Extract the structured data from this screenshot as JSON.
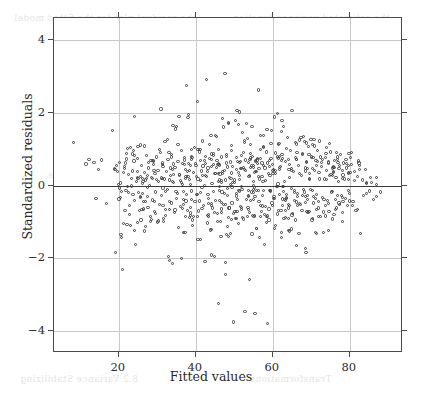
{
  "figure": {
    "name": "residuals-vs-fitted-scatter",
    "background_color": "#ffffff",
    "frame_color": "#4a4a4a",
    "grid_color": "#c8c8c8",
    "zero_line_color": "#3a3a3a",
    "point_color": "#3c3c3c"
  },
  "axis": {
    "x_label": "Fitted values",
    "y_label": "Standardized residuals",
    "x_ticks": [
      20,
      40,
      60,
      80
    ],
    "y_ticks": [
      4,
      2,
      0,
      -2,
      -4
    ],
    "x_tick_labels": [
      "20",
      "40",
      "60",
      "80"
    ],
    "y_tick_labels": [
      "4",
      "2",
      "0",
      "−2",
      "−4"
    ]
  },
  "bleed_text": [
    {
      "text": "the residual plot for the fitted model",
      "x": 14,
      "y": 13,
      "size": 9
    },
    {
      "text": "the estimated variance function",
      "x": 232,
      "y": 13,
      "size": 9
    },
    {
      "text": "standard deviation",
      "x": 66,
      "y": 86,
      "size": 9
    },
    {
      "text": "and the mean function",
      "x": 200,
      "y": 86,
      "size": 9
    },
    {
      "text": "residuals against",
      "x": 80,
      "y": 142,
      "size": 9
    },
    {
      "text": "the fitted values are",
      "x": 236,
      "y": 142,
      "size": 9
    },
    {
      "text": "of the variance",
      "x": 48,
      "y": 170,
      "size": 9
    },
    {
      "text": "plotted in",
      "x": 250,
      "y": 170,
      "size": 9
    },
    {
      "text": "nonconstant variance",
      "x": 196,
      "y": 280,
      "size": 9
    },
    {
      "text": "8.2  Variance Stabilizing",
      "x": 20,
      "y": 374,
      "size": 9
    },
    {
      "text": "Transformations",
      "x": 250,
      "y": 374,
      "size": 9
    }
  ],
  "chart_data": {
    "type": "scatter",
    "title": "",
    "subtitle": "",
    "xlabel": "Fitted values",
    "ylabel": "Standardized residuals",
    "xlim": [
      3.2,
      93.8
    ],
    "ylim": [
      -4.6,
      4.6
    ],
    "grid": true,
    "legend": null,
    "annotations": [
      {
        "type": "hline",
        "y": 0,
        "description": "reference line at zero residual"
      }
    ],
    "x_ticks": [
      20,
      40,
      60,
      80
    ],
    "y_ticks": [
      4,
      2,
      0,
      -2,
      -4
    ],
    "n_points": 812,
    "marker": {
      "shape": "open-circle",
      "size_px": 3.2,
      "stroke": "#3c3c3c",
      "fill": "none"
    },
    "points": [
      [
        8.2,
        1.18
      ],
      [
        11.5,
        0.59
      ],
      [
        12.3,
        0.72
      ],
      [
        13.6,
        0.63
      ],
      [
        14.1,
        -0.35
      ],
      [
        14.8,
        0.45
      ],
      [
        15.6,
        0.7
      ],
      [
        16.9,
        -0.5
      ],
      [
        18.4,
        1.5
      ],
      [
        18.9,
        0.46
      ],
      [
        19.1,
        -1.85
      ],
      [
        19.6,
        0.38
      ],
      [
        19.9,
        0.03
      ],
      [
        20.1,
        -0.07
      ],
      [
        20.4,
        -0.32
      ],
      [
        20.6,
        -1.35
      ],
      [
        20.8,
        -1.42
      ],
      [
        21.0,
        -2.3
      ],
      [
        21.2,
        -1.05
      ],
      [
        21.5,
        0.52
      ],
      [
        21.7,
        0.62
      ],
      [
        21.9,
        -0.13
      ],
      [
        22.1,
        0.88
      ],
      [
        22.3,
        1.02
      ],
      [
        22.5,
        0.3
      ],
      [
        22.7,
        -0.55
      ],
      [
        22.9,
        -0.8
      ],
      [
        23.1,
        -1.1
      ],
      [
        23.3,
        0.2
      ],
      [
        23.5,
        0.4
      ],
      [
        23.7,
        -0.25
      ],
      [
        23.9,
        0.95
      ],
      [
        24.1,
        1.9
      ],
      [
        24.2,
        -0.42
      ],
      [
        24.4,
        -1.62
      ],
      [
        24.6,
        0.12
      ],
      [
        24.8,
        0.75
      ],
      [
        25.0,
        1.08
      ],
      [
        25.2,
        -0.2
      ],
      [
        25.4,
        -0.68
      ],
      [
        25.6,
        0.25
      ],
      [
        25.8,
        -0.95
      ],
      [
        26.0,
        0.55
      ],
      [
        26.2,
        0.05
      ],
      [
        26.4,
        -0.45
      ],
      [
        26.6,
        0.35
      ],
      [
        26.8,
        -1.25
      ],
      [
        27.0,
        0.15
      ],
      [
        27.2,
        0.82
      ],
      [
        27.4,
        -0.3
      ],
      [
        27.6,
        -0.6
      ],
      [
        27.8,
        0.48
      ],
      [
        28.0,
        0.0
      ],
      [
        28.2,
        -0.85
      ],
      [
        28.4,
        0.68
      ],
      [
        28.6,
        0.22
      ],
      [
        28.8,
        -0.4
      ],
      [
        29.0,
        0.58
      ],
      [
        29.2,
        -0.72
      ],
      [
        29.4,
        0.32
      ],
      [
        29.6,
        -0.18
      ],
      [
        29.8,
        0.78
      ],
      [
        30.0,
        -1.0
      ],
      [
        30.2,
        0.42
      ],
      [
        30.4,
        0.1
      ],
      [
        30.6,
        -0.52
      ],
      [
        30.8,
        0.9
      ],
      [
        31.0,
        2.1
      ],
      [
        31.2,
        -0.28
      ],
      [
        31.4,
        0.62
      ],
      [
        31.6,
        -0.9
      ],
      [
        31.8,
        0.18
      ],
      [
        32.0,
        1.2
      ],
      [
        32.2,
        -0.65
      ],
      [
        32.4,
        0.38
      ],
      [
        32.6,
        -0.12
      ],
      [
        32.8,
        0.72
      ],
      [
        33.0,
        -1.95
      ],
      [
        33.2,
        -2.05
      ],
      [
        33.4,
        0.28
      ],
      [
        33.6,
        -0.48
      ],
      [
        33.8,
        0.85
      ],
      [
        34.0,
        -2.15
      ],
      [
        34.2,
        0.08
      ],
      [
        34.4,
        -0.75
      ],
      [
        34.6,
        0.5
      ],
      [
        34.8,
        1.55
      ],
      [
        35.0,
        1.62
      ],
      [
        35.2,
        -0.22
      ],
      [
        35.4,
        0.65
      ],
      [
        35.6,
        -1.15
      ],
      [
        35.8,
        0.3
      ],
      [
        36.0,
        -0.58
      ],
      [
        36.2,
        0.95
      ],
      [
        36.4,
        -2.0
      ],
      [
        36.6,
        0.02
      ],
      [
        36.8,
        -0.38
      ],
      [
        37.0,
        0.7
      ],
      [
        37.2,
        -1.3
      ],
      [
        37.4,
        0.45
      ],
      [
        37.6,
        2.75
      ],
      [
        37.8,
        -0.68
      ],
      [
        38.0,
        0.25
      ],
      [
        38.2,
        1.95
      ],
      [
        38.4,
        -0.88
      ],
      [
        38.6,
        0.55
      ],
      [
        38.8,
        -0.15
      ],
      [
        39.0,
        0.8
      ],
      [
        39.2,
        -0.95
      ],
      [
        39.4,
        0.35
      ],
      [
        39.6,
        1.05
      ],
      [
        39.8,
        -0.45
      ],
      [
        40.0,
        0.6
      ],
      [
        40.2,
        -0.25
      ],
      [
        40.4,
        2.3
      ],
      [
        40.6,
        0.18
      ],
      [
        40.8,
        -0.7
      ],
      [
        41.0,
        0.92
      ],
      [
        41.2,
        -1.48
      ],
      [
        41.4,
        0.4
      ],
      [
        41.6,
        -0.05
      ],
      [
        41.8,
        1.22
      ],
      [
        42.0,
        -0.55
      ],
      [
        42.2,
        0.68
      ],
      [
        42.4,
        -2.08
      ],
      [
        42.6,
        0.28
      ],
      [
        42.8,
        2.9
      ],
      [
        43.0,
        -0.82
      ],
      [
        43.2,
        0.48
      ],
      [
        43.4,
        -0.35
      ],
      [
        43.6,
        1.12
      ],
      [
        43.8,
        -1.22
      ],
      [
        44.0,
        0.72
      ],
      [
        44.2,
        0.05
      ],
      [
        44.4,
        -0.62
      ],
      [
        44.6,
        0.88
      ],
      [
        44.8,
        -1.95
      ],
      [
        45.0,
        0.32
      ],
      [
        45.2,
        -0.42
      ],
      [
        45.4,
        1.35
      ],
      [
        45.6,
        -0.78
      ],
      [
        45.8,
        0.58
      ],
      [
        46.0,
        -3.25
      ],
      [
        46.2,
        0.15
      ],
      [
        46.4,
        -0.98
      ],
      [
        46.6,
        0.78
      ],
      [
        46.8,
        -0.18
      ],
      [
        47.0,
        1.85
      ],
      [
        47.2,
        -0.52
      ],
      [
        47.4,
        0.42
      ],
      [
        47.6,
        3.08
      ],
      [
        47.8,
        -2.12
      ],
      [
        48.0,
        0.62
      ],
      [
        48.2,
        -0.28
      ],
      [
        48.4,
        1.7
      ],
      [
        48.6,
        -0.88
      ],
      [
        48.8,
        0.22
      ],
      [
        49.0,
        -1.32
      ],
      [
        49.2,
        0.95
      ],
      [
        49.4,
        -0.48
      ],
      [
        49.6,
        0.52
      ],
      [
        49.8,
        -3.75
      ],
      [
        50.0,
        0.08
      ],
      [
        50.2,
        -0.72
      ],
      [
        50.4,
        1.78
      ],
      [
        50.6,
        -0.22
      ],
      [
        50.8,
        0.65
      ],
      [
        51.0,
        -1.05
      ],
      [
        51.2,
        0.35
      ],
      [
        51.4,
        2.02
      ],
      [
        51.6,
        -0.58
      ],
      [
        51.8,
        0.82
      ],
      [
        52.0,
        -0.12
      ],
      [
        52.2,
        1.45
      ],
      [
        52.4,
        -0.92
      ],
      [
        52.6,
        0.45
      ],
      [
        52.8,
        -3.45
      ],
      [
        53.0,
        0.7
      ],
      [
        53.2,
        -0.38
      ],
      [
        53.4,
        1.28
      ],
      [
        53.6,
        -0.65
      ],
      [
        53.8,
        0.25
      ],
      [
        54.0,
        -2.58
      ],
      [
        54.2,
        0.88
      ],
      [
        54.4,
        -0.18
      ],
      [
        54.6,
        1.62
      ],
      [
        54.8,
        -0.82
      ],
      [
        55.0,
        0.55
      ],
      [
        55.2,
        -0.05
      ],
      [
        55.4,
        -3.52
      ],
      [
        55.6,
        0.38
      ],
      [
        55.8,
        -1.18
      ],
      [
        56.0,
        0.75
      ],
      [
        56.2,
        2.62
      ],
      [
        56.4,
        -0.45
      ],
      [
        56.6,
        0.18
      ],
      [
        56.8,
        1.38
      ],
      [
        57.0,
        -0.72
      ],
      [
        57.2,
        0.62
      ],
      [
        57.4,
        -0.28
      ],
      [
        57.6,
        1.05
      ],
      [
        57.8,
        -1.62
      ],
      [
        58.0,
        0.48
      ],
      [
        58.2,
        -0.58
      ],
      [
        58.4,
        0.92
      ],
      [
        58.6,
        -3.78
      ],
      [
        58.8,
        0.32
      ],
      [
        59.0,
        -0.95
      ],
      [
        59.2,
        0.68
      ],
      [
        59.4,
        -0.15
      ],
      [
        59.6,
        1.52
      ],
      [
        59.8,
        -0.48
      ],
      [
        60.0,
        0.58
      ],
      [
        60.2,
        -0.35
      ],
      [
        60.4,
        1.88
      ],
      [
        60.6,
        -1.1
      ],
      [
        60.8,
        0.42
      ],
      [
        61.0,
        -0.02
      ],
      [
        61.2,
        0.78
      ],
      [
        61.4,
        -0.68
      ],
      [
        61.6,
        1.15
      ],
      [
        61.8,
        -0.25
      ],
      [
        62.0,
        0.52
      ],
      [
        62.2,
        -1.42
      ],
      [
        62.4,
        0.85
      ],
      [
        62.6,
        -0.55
      ],
      [
        62.8,
        1.62
      ],
      [
        63.0,
        0.12
      ],
      [
        63.2,
        -0.88
      ],
      [
        63.4,
        0.65
      ],
      [
        63.6,
        -0.32
      ],
      [
        63.8,
        1.32
      ],
      [
        64.0,
        -0.62
      ],
      [
        64.2,
        0.45
      ],
      [
        64.4,
        -1.25
      ],
      [
        64.6,
        0.95
      ],
      [
        64.8,
        -0.08
      ],
      [
        65.0,
        2.05
      ],
      [
        65.2,
        -0.78
      ],
      [
        65.4,
        0.38
      ],
      [
        65.6,
        -0.42
      ],
      [
        65.8,
        1.18
      ],
      [
        66.0,
        -0.95
      ],
      [
        66.2,
        0.72
      ],
      [
        66.4,
        -0.22
      ],
      [
        66.6,
        0.55
      ],
      [
        66.8,
        -1.32
      ],
      [
        67.0,
        1.25
      ],
      [
        67.2,
        -0.52
      ],
      [
        67.4,
        0.28
      ],
      [
        67.6,
        -0.68
      ],
      [
        67.8,
        0.88
      ],
      [
        68.0,
        1.35
      ],
      [
        68.2,
        -0.18
      ],
      [
        68.4,
        0.48
      ],
      [
        68.6,
        -1.85
      ],
      [
        68.8,
        0.65
      ],
      [
        69.0,
        -0.38
      ],
      [
        69.2,
        1.08
      ],
      [
        69.4,
        -0.72
      ],
      [
        69.6,
        0.32
      ],
      [
        69.8,
        -0.12
      ],
      [
        70.0,
        0.78
      ],
      [
        70.2,
        -0.95
      ],
      [
        70.4,
        1.12
      ],
      [
        70.6,
        -0.48
      ],
      [
        70.8,
        0.42
      ],
      [
        71.0,
        -1.28
      ],
      [
        71.2,
        0.68
      ],
      [
        71.4,
        -0.25
      ],
      [
        71.6,
        0.95
      ],
      [
        71.8,
        -0.62
      ],
      [
        72.0,
        0.35
      ],
      [
        72.2,
        1.22
      ],
      [
        72.4,
        -0.85
      ],
      [
        72.6,
        0.52
      ],
      [
        72.8,
        -0.32
      ],
      [
        73.0,
        0.72
      ],
      [
        73.2,
        -1.28
      ],
      [
        73.4,
        0.18
      ],
      [
        73.6,
        -0.55
      ],
      [
        73.8,
        0.88
      ],
      [
        74.0,
        0.42
      ],
      [
        74.2,
        -0.42
      ],
      [
        74.4,
        0.62
      ],
      [
        74.6,
        -0.72
      ],
      [
        74.8,
        0.28
      ],
      [
        75.0,
        0.92
      ],
      [
        75.2,
        -0.18
      ],
      [
        75.4,
        0.48
      ],
      [
        75.6,
        -0.92
      ],
      [
        75.8,
        0.35
      ],
      [
        76.0,
        0.68
      ],
      [
        76.2,
        -0.38
      ],
      [
        76.4,
        0.22
      ],
      [
        76.6,
        -0.62
      ],
      [
        76.8,
        0.78
      ],
      [
        77.0,
        0.12
      ],
      [
        77.2,
        -0.48
      ],
      [
        77.4,
        0.55
      ],
      [
        77.6,
        0.85
      ],
      [
        77.8,
        -0.28
      ],
      [
        78.0,
        0.42
      ],
      [
        78.2,
        -0.75
      ],
      [
        78.4,
        0.62
      ],
      [
        78.6,
        0.18
      ],
      [
        78.8,
        -0.35
      ],
      [
        79.0,
        0.72
      ],
      [
        79.2,
        0.48
      ],
      [
        79.4,
        -0.55
      ],
      [
        79.6,
        0.32
      ],
      [
        79.8,
        0.88
      ],
      [
        80.0,
        -0.22
      ],
      [
        80.4,
        0.58
      ],
      [
        80.8,
        -0.45
      ],
      [
        81.2,
        0.38
      ],
      [
        81.6,
        -0.68
      ],
      [
        82.0,
        0.25
      ],
      [
        82.4,
        0.62
      ],
      [
        82.8,
        -1.32
      ],
      [
        83.2,
        0.15
      ],
      [
        83.6,
        -0.28
      ],
      [
        84.0,
        0.45
      ],
      [
        84.4,
        0.05
      ],
      [
        85.0,
        -0.15
      ],
      [
        85.6,
        0.08
      ],
      [
        86.2,
        -0.38
      ],
      [
        87.0,
        0.02
      ],
      [
        88.0,
        -0.18
      ]
    ]
  }
}
